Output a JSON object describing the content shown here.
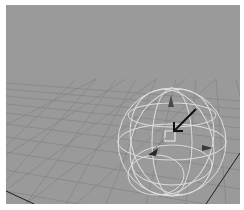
{
  "viewport": {
    "type": "3d-perspective-view",
    "background_color": "#9a9a9a",
    "grid_color": "#8a8a8a",
    "axis_line_color": "#1e1e1e",
    "manipulator": {
      "name": "sphere-manipulator",
      "wire_color": "#e8e8e8",
      "arrow_color": "#1a1a1a",
      "cone_color": "#3a3a3a"
    }
  }
}
